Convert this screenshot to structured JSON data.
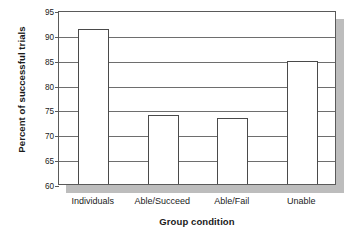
{
  "chart_data": {
    "type": "bar",
    "title": "",
    "xlabel": "Group condition",
    "ylabel": "Percent of successful trials",
    "categories": [
      "Individuals",
      "Able/Succeed",
      "Able/Fail",
      "Unable"
    ],
    "values": [
      91.1,
      73.8,
      73.3,
      84.8
    ],
    "ylim": [
      60,
      95
    ],
    "yticks": [
      60,
      65,
      70,
      75,
      80,
      85,
      90,
      95
    ],
    "ytick_labels": [
      "60",
      "65",
      "70",
      "75",
      "80",
      "85",
      "90",
      "95"
    ],
    "grid": true,
    "grid_axis": "y",
    "legend": false,
    "legend_position": "none",
    "bar_fill_color": "#ffffff",
    "bar_edge_color": "#4a4a4a",
    "axis_color": "#5a5a5a",
    "gridline_color": "#6e6e6e",
    "background_color": "#ffffff",
    "shadow_color": "#bdbdbd",
    "text_color": "#1a1a1a"
  }
}
